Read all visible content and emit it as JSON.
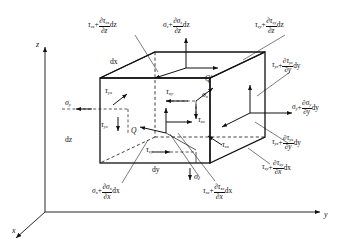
{
  "figure": {
    "type": "stress-element-diagram",
    "background_color": "#ffffff",
    "line_color": "#111111"
  },
  "axes": {
    "x_label": "x",
    "y_label": "y",
    "z_label": "z"
  },
  "dimensions": {
    "dx": "dx",
    "dy": "dy",
    "dz": "dz"
  },
  "points": {
    "q": "Q",
    "q_prime": "Q′"
  },
  "inner_labels": {
    "sigma_y": {
      "base": "σ",
      "sub": "y"
    },
    "sigma_x": {
      "base": "σ",
      "sub": "x"
    },
    "sigma_z": {
      "base": "σ",
      "sub": "z"
    },
    "tau_yx": {
      "base": "τ",
      "sub": "yx"
    },
    "tau_yz": {
      "base": "τ",
      "sub": "yz"
    },
    "tau_xy": {
      "base": "τ",
      "sub": "xy"
    },
    "tau_xz": {
      "base": "τ",
      "sub": "xz"
    },
    "tau_zy": {
      "base": "τ",
      "sub": "zy"
    },
    "tau_zx": {
      "base": "τ",
      "sub": "zx"
    }
  },
  "stress_equations": [
    {
      "id": "tau-zx-top-left",
      "position": "top-left",
      "base_symbol": "τ",
      "base_sub": "zx",
      "partial_numerator_symbol": "τ",
      "partial_numerator_sub": "zx",
      "partial_denominator": "z",
      "differential": "dz",
      "text": "τzx + ∂τzx/∂z dz"
    },
    {
      "id": "sigma-z-top",
      "position": "top-center",
      "base_symbol": "σ",
      "base_sub": "z",
      "partial_numerator_symbol": "σ",
      "partial_numerator_sub": "z",
      "partial_denominator": "z",
      "differential": "dz",
      "text": "σz + ∂σz/∂z dz"
    },
    {
      "id": "tau-zy-top-right",
      "position": "top-right",
      "base_symbol": "τ",
      "base_sub": "zy",
      "partial_numerator_symbol": "τ",
      "partial_numerator_sub": "zy",
      "partial_denominator": "z",
      "differential": "dz",
      "text": "τzy + ∂τzy/∂z dz"
    },
    {
      "id": "tau-yz-right-upper",
      "position": "right-upper",
      "base_symbol": "τ",
      "base_sub": "yz",
      "partial_numerator_symbol": "τ",
      "partial_numerator_sub": "yz",
      "partial_denominator": "y",
      "differential": "dy",
      "text": "τyz + ∂τyz/∂y dy"
    },
    {
      "id": "sigma-y-right",
      "position": "right-middle",
      "base_symbol": "σ",
      "base_sub": "y",
      "partial_numerator_symbol": "σ",
      "partial_numerator_sub": "y",
      "partial_denominator": "y",
      "differential": "dy",
      "text": "σy + ∂σy/∂y dy"
    },
    {
      "id": "tau-yx-right-lower",
      "position": "right-lower",
      "base_symbol": "τ",
      "base_sub": "yx",
      "partial_numerator_symbol": "τ",
      "partial_numerator_sub": "yx",
      "partial_denominator": "y",
      "differential": "dy",
      "text": "τyx + ∂τyx/∂y dy"
    },
    {
      "id": "tau-xy-bottom-right",
      "position": "bottom-right",
      "base_symbol": "τ",
      "base_sub": "xy",
      "partial_numerator_symbol": "τ",
      "partial_numerator_sub": "xy",
      "partial_denominator": "x",
      "differential": "dx",
      "text": "τxy + ∂τxy/∂x dx"
    },
    {
      "id": "sigma-x-bottom-left",
      "position": "bottom-left",
      "base_symbol": "σ",
      "base_sub": "x",
      "partial_numerator_symbol": "σ",
      "partial_numerator_sub": "x",
      "partial_denominator": "x",
      "differential": "dx",
      "text": "σx + ∂σx/∂x dx"
    },
    {
      "id": "tau-xz-bottom-center",
      "position": "bottom-center",
      "base_symbol": "τ",
      "base_sub": "xz",
      "partial_numerator_symbol": "τ",
      "partial_numerator_sub": "xz",
      "partial_denominator": "x",
      "differential": "dx",
      "text": "τxz + ∂τxz/∂x dx"
    }
  ],
  "symbols": {
    "partial": "∂",
    "plus": "+",
    "d": "d"
  }
}
